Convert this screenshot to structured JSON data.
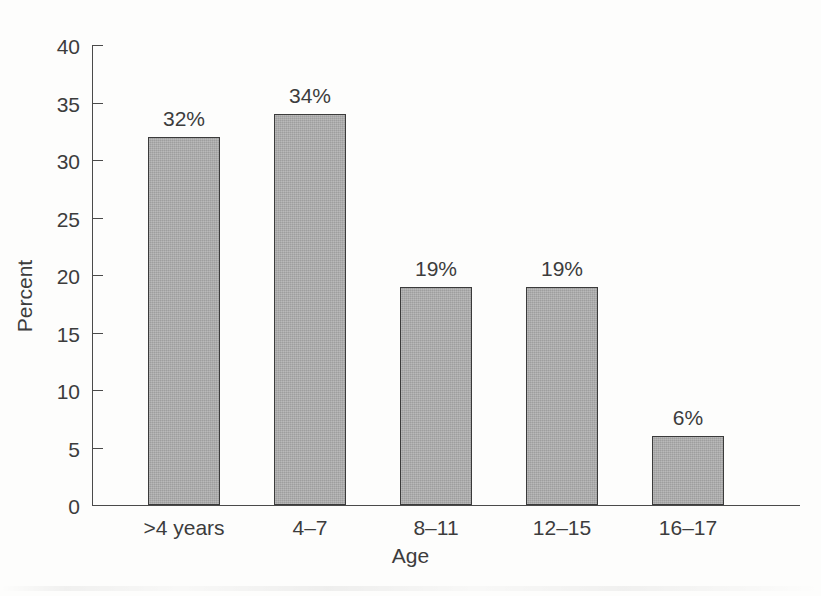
{
  "chart_data": {
    "type": "bar",
    "title": "",
    "xlabel": "Age",
    "ylabel": "Percent",
    "categories": [
      ">4 years",
      "4–7",
      "8–11",
      "12–15",
      "16–17"
    ],
    "values": [
      32,
      34,
      19,
      19,
      6
    ],
    "data_labels": [
      "32%",
      "34%",
      "19%",
      "19%",
      "6%"
    ],
    "ylim": [
      0,
      40
    ],
    "ytick_values": [
      0,
      5,
      10,
      15,
      20,
      25,
      30,
      35,
      40
    ],
    "ytick_labels": [
      "0",
      "5",
      "10",
      "15",
      "20",
      "25",
      "30",
      "35",
      "40"
    ],
    "grid": false,
    "legend": false,
    "legend_position": "none",
    "bar_fill_color": "#a9a9a9",
    "bar_edge_color": "#3b3b3b",
    "text_color": "#3c3c3c",
    "background_color": "#fdfdfc"
  }
}
